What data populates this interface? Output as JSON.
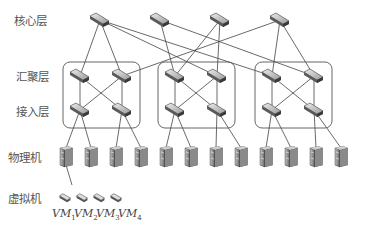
{
  "layers": {
    "core": "核心层",
    "aggregation": "汇聚层",
    "access": "接入层",
    "physical": "物理机",
    "virtual": "虚拟机"
  },
  "vms": [
    {
      "name": "VM",
      "index": "1"
    },
    {
      "name": "VM",
      "index": "2"
    },
    {
      "name": "VM",
      "index": "3"
    },
    {
      "name": "VM",
      "index": "4"
    }
  ],
  "topology": {
    "core_switches": [
      [
        100,
        20
      ],
      [
        160,
        20
      ],
      [
        220,
        20
      ],
      [
        280,
        20
      ]
    ],
    "pods": [
      {
        "box": [
          63,
          62,
          77,
          66
        ],
        "agg": [
          [
            80,
            76
          ],
          [
            122,
            76
          ]
        ],
        "access": [
          [
            80,
            110
          ],
          [
            122,
            110
          ]
        ]
      },
      {
        "box": [
          158,
          62,
          77,
          66
        ],
        "agg": [
          [
            175,
            76
          ],
          [
            217,
            76
          ]
        ],
        "access": [
          [
            175,
            110
          ],
          [
            217,
            110
          ]
        ]
      },
      {
        "box": [
          255,
          62,
          77,
          66
        ],
        "agg": [
          [
            272,
            76
          ],
          [
            314,
            76
          ]
        ],
        "access": [
          [
            272,
            110
          ],
          [
            314,
            110
          ]
        ]
      }
    ],
    "core_links": [
      [
        0,
        0,
        0
      ],
      [
        0,
        0,
        1
      ],
      [
        0,
        1,
        1
      ],
      [
        0,
        2,
        0
      ],
      [
        1,
        1,
        0
      ],
      [
        1,
        2,
        1
      ],
      [
        2,
        1,
        0
      ],
      [
        2,
        1,
        1
      ],
      [
        3,
        0,
        1
      ],
      [
        3,
        2,
        0
      ],
      [
        3,
        2,
        1
      ]
    ],
    "servers_x": [
      66,
      91,
      116,
      141,
      166,
      191,
      216,
      241,
      266,
      291,
      316,
      341
    ],
    "servers_y": 156,
    "vms_x": [
      65,
      82,
      99,
      116
    ],
    "vms_y": 198
  },
  "colors": {
    "line": "#444444",
    "box": "#555555",
    "device_light": "#d8d8d8",
    "device_dark": "#5a5a5a"
  }
}
